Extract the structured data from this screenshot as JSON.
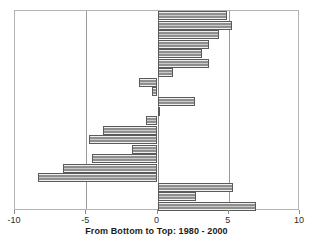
{
  "chart_data": {
    "type": "bar",
    "orientation": "horizontal",
    "title": "",
    "xlabel": "From Bottom to Top: 1980 - 2000",
    "ylabel": "",
    "xlim": [
      -10,
      10
    ],
    "xticks": [
      -10,
      -5,
      0,
      5,
      10
    ],
    "xticklabels": [
      "-10",
      "-5",
      "0",
      "5",
      "10"
    ],
    "grid": true,
    "gridlines_x": [
      -5,
      0,
      5
    ],
    "legend": null,
    "categories": [
      "row-21",
      "row-20",
      "row-19",
      "row-18",
      "row-17",
      "row-16",
      "row-15",
      "row-14",
      "row-13",
      "row-12",
      "row-11",
      "row-10",
      "row-9",
      "row-8",
      "row-7",
      "row-6",
      "row-5",
      "row-4",
      "row-3",
      "row-2",
      "row-1"
    ],
    "values": [
      4.9,
      5.2,
      4.3,
      3.6,
      3.1,
      3.6,
      1.1,
      -1.3,
      -0.4,
      2.6,
      0.1,
      -0.8,
      -3.8,
      -4.8,
      -1.8,
      -4.6,
      -6.6,
      -8.4,
      5.3,
      2.7,
      6.9
    ],
    "bar_color": "#9a9a9a",
    "bar_edge_color": "#5a5a5a"
  },
  "axis": {
    "tick_labels": [
      "-10",
      "-5",
      "0",
      "5",
      "10"
    ],
    "title": "From Bottom to Top: 1980 - 2000"
  }
}
